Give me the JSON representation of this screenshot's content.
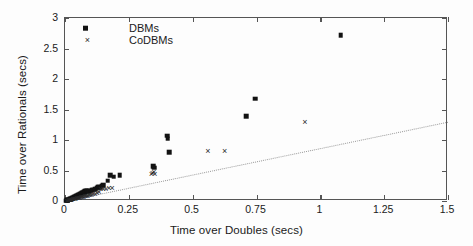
{
  "chart_data": {
    "type": "scatter",
    "title": "",
    "xlabel": "Time over Doubles (secs)",
    "ylabel": "Time over Rationals (secs)",
    "xlim": [
      0,
      1.5
    ],
    "ylim": [
      0,
      3
    ],
    "xticks": [
      0,
      0.25,
      0.5,
      0.75,
      1,
      1.25,
      1.5
    ],
    "xticklabels": [
      "0",
      "0.25",
      "0.5",
      "0.75",
      "1",
      "1.25",
      "1.5"
    ],
    "yticks": [
      0,
      0.5,
      1,
      1.5,
      2,
      2.5,
      3
    ],
    "yticklabels": [
      "0",
      "0.5",
      "1",
      "1.5",
      "2",
      "2.5",
      "3"
    ],
    "grid": false,
    "legend_position": "top-left",
    "series": [
      {
        "name": "DBMs",
        "marker": "filled-square",
        "color": "#121212",
        "points": [
          [
            0.004,
            0.006
          ],
          [
            0.006,
            0.009
          ],
          [
            0.008,
            0.012
          ],
          [
            0.01,
            0.014
          ],
          [
            0.012,
            0.018
          ],
          [
            0.014,
            0.021
          ],
          [
            0.016,
            0.024
          ],
          [
            0.018,
            0.027
          ],
          [
            0.02,
            0.03
          ],
          [
            0.022,
            0.033
          ],
          [
            0.024,
            0.036
          ],
          [
            0.026,
            0.04
          ],
          [
            0.028,
            0.043
          ],
          [
            0.03,
            0.047
          ],
          [
            0.032,
            0.051
          ],
          [
            0.034,
            0.054
          ],
          [
            0.036,
            0.058
          ],
          [
            0.038,
            0.062
          ],
          [
            0.04,
            0.066
          ],
          [
            0.042,
            0.07
          ],
          [
            0.044,
            0.074
          ],
          [
            0.046,
            0.078
          ],
          [
            0.048,
            0.083
          ],
          [
            0.05,
            0.087
          ],
          [
            0.052,
            0.092
          ],
          [
            0.054,
            0.096
          ],
          [
            0.056,
            0.101
          ],
          [
            0.058,
            0.105
          ],
          [
            0.06,
            0.11
          ],
          [
            0.062,
            0.114
          ],
          [
            0.064,
            0.119
          ],
          [
            0.066,
            0.124
          ],
          [
            0.068,
            0.129
          ],
          [
            0.07,
            0.133
          ],
          [
            0.072,
            0.138
          ],
          [
            0.074,
            0.143
          ],
          [
            0.076,
            0.147
          ],
          [
            0.078,
            0.152
          ],
          [
            0.08,
            0.157
          ],
          [
            0.082,
            0.16
          ],
          [
            0.085,
            0.165
          ],
          [
            0.088,
            0.17
          ],
          [
            0.09,
            0.15
          ],
          [
            0.095,
            0.162
          ],
          [
            0.1,
            0.172
          ],
          [
            0.105,
            0.178
          ],
          [
            0.11,
            0.183
          ],
          [
            0.118,
            0.19
          ],
          [
            0.125,
            0.215
          ],
          [
            0.13,
            0.23
          ],
          [
            0.135,
            0.235
          ],
          [
            0.14,
            0.22
          ],
          [
            0.143,
            0.25
          ],
          [
            0.15,
            0.26
          ],
          [
            0.168,
            0.33
          ],
          [
            0.178,
            0.42
          ],
          [
            0.19,
            0.4
          ],
          [
            0.215,
            0.425
          ],
          [
            0.345,
            0.57
          ],
          [
            0.35,
            0.545
          ],
          [
            0.4,
            1.07
          ],
          [
            0.403,
            1.02
          ],
          [
            0.408,
            0.8
          ],
          [
            0.71,
            1.39
          ],
          [
            0.745,
            1.68
          ],
          [
            1.08,
            2.715
          ]
        ]
      },
      {
        "name": "CoDBMs",
        "marker": "cross",
        "color": "#2a2a2a",
        "points": [
          [
            0.006,
            0.004
          ],
          [
            0.01,
            0.008
          ],
          [
            0.014,
            0.012
          ],
          [
            0.018,
            0.016
          ],
          [
            0.022,
            0.02
          ],
          [
            0.026,
            0.024
          ],
          [
            0.03,
            0.028
          ],
          [
            0.034,
            0.032
          ],
          [
            0.038,
            0.036
          ],
          [
            0.042,
            0.04
          ],
          [
            0.046,
            0.044
          ],
          [
            0.05,
            0.048
          ],
          [
            0.054,
            0.052
          ],
          [
            0.058,
            0.056
          ],
          [
            0.062,
            0.06
          ],
          [
            0.066,
            0.064
          ],
          [
            0.07,
            0.068
          ],
          [
            0.074,
            0.072
          ],
          [
            0.078,
            0.076
          ],
          [
            0.082,
            0.08
          ],
          [
            0.086,
            0.084
          ],
          [
            0.09,
            0.088
          ],
          [
            0.094,
            0.092
          ],
          [
            0.098,
            0.096
          ],
          [
            0.104,
            0.104
          ],
          [
            0.11,
            0.112
          ],
          [
            0.118,
            0.12
          ],
          [
            0.126,
            0.13
          ],
          [
            0.134,
            0.14
          ],
          [
            0.14,
            0.195
          ],
          [
            0.15,
            0.2
          ],
          [
            0.16,
            0.2
          ],
          [
            0.172,
            0.205
          ],
          [
            0.185,
            0.205
          ],
          [
            0.338,
            0.44
          ],
          [
            0.342,
            0.455
          ],
          [
            0.348,
            0.47
          ],
          [
            0.352,
            0.445
          ],
          [
            0.56,
            0.82
          ],
          [
            0.625,
            0.815
          ],
          [
            0.94,
            1.29
          ]
        ]
      }
    ],
    "reference_line": {
      "name": "diagonal-reference",
      "style": "dotted",
      "color": "#9a9a9a",
      "from": [
        0,
        0
      ],
      "to": [
        1.5,
        1.3
      ]
    }
  },
  "legend": {
    "entries": [
      {
        "label": "DBMs",
        "marker": "filled-square"
      },
      {
        "label": "CoDBMs",
        "marker": "cross"
      }
    ]
  }
}
